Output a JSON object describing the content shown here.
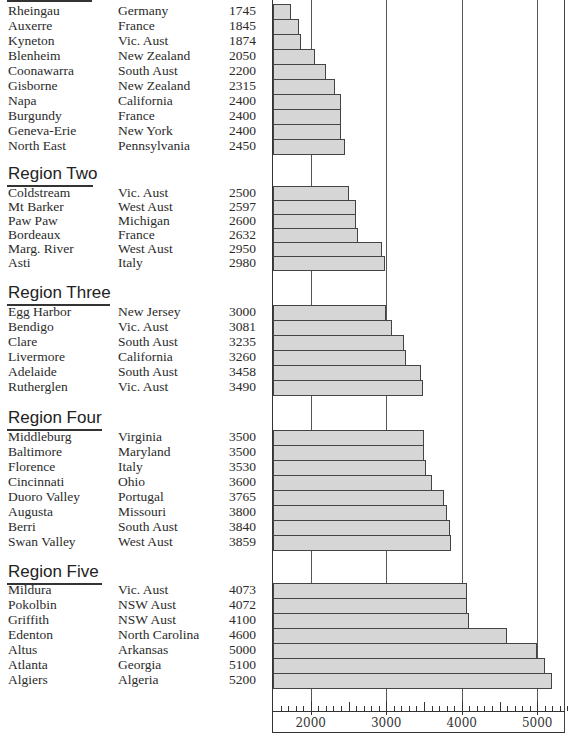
{
  "chart_data": {
    "type": "bar",
    "orientation": "horizontal",
    "title": "",
    "xlabel": "",
    "ylabel": "",
    "xlim": [
      1500,
      5400
    ],
    "x_ticks": [
      2000,
      3000,
      4000,
      5000
    ],
    "x_tick_labels": [
      "2000",
      "3000",
      "4000",
      "5000"
    ],
    "minor_tick_step": 100,
    "gridlines": "vertical at major ticks",
    "bar_color": "#d6d6d6",
    "bar_edge_color": "#444444",
    "groups": [
      {
        "name": "Region One",
        "heading_visible": false,
        "rows": [
          {
            "place": "Rheingau",
            "location": "Germany",
            "value": 1745
          },
          {
            "place": "Auxerre",
            "location": "France",
            "value": 1845
          },
          {
            "place": "Kyneton",
            "location": "Vic. Aust",
            "value": 1874
          },
          {
            "place": "Blenheim",
            "location": "New Zealand",
            "value": 2050
          },
          {
            "place": "Coonawarra",
            "location": "South Aust",
            "value": 2200
          },
          {
            "place": "Gisborne",
            "location": "New Zealand",
            "value": 2315
          },
          {
            "place": "Napa",
            "location": "California",
            "value": 2400
          },
          {
            "place": "Burgundy",
            "location": "France",
            "value": 2400
          },
          {
            "place": "Geneva-Erie",
            "location": "New York",
            "value": 2400
          },
          {
            "place": "North East",
            "location": "Pennsylvania",
            "value": 2450
          }
        ]
      },
      {
        "name": "Region Two",
        "heading_visible": true,
        "rows": [
          {
            "place": "Coldstream",
            "location": "Vic. Aust",
            "value": 2500
          },
          {
            "place": "Mt Barker",
            "location": "West Aust",
            "value": 2597
          },
          {
            "place": "Paw Paw",
            "location": "Michigan",
            "value": 2600
          },
          {
            "place": "Bordeaux",
            "location": "France",
            "value": 2632
          },
          {
            "place": "Marg. River",
            "location": "West Aust",
            "value": 2950
          },
          {
            "place": "Asti",
            "location": "Italy",
            "value": 2980
          }
        ]
      },
      {
        "name": "Region Three",
        "heading_visible": true,
        "rows": [
          {
            "place": "Egg Harbor",
            "location": "New Jersey",
            "value": 3000
          },
          {
            "place": "Bendigo",
            "location": "Vic. Aust",
            "value": 3081
          },
          {
            "place": "Clare",
            "location": "South Aust",
            "value": 3235
          },
          {
            "place": "Livermore",
            "location": "California",
            "value": 3260
          },
          {
            "place": "Adelaide",
            "location": "South Aust",
            "value": 3458
          },
          {
            "place": "Rutherglen",
            "location": "Vic. Aust",
            "value": 3490
          }
        ]
      },
      {
        "name": "Region Four",
        "heading_visible": true,
        "rows": [
          {
            "place": "Middleburg",
            "location": "Virginia",
            "value": 3500
          },
          {
            "place": "Baltimore",
            "location": "Maryland",
            "value": 3500
          },
          {
            "place": "Florence",
            "location": "Italy",
            "value": 3530
          },
          {
            "place": "Cincinnati",
            "location": "Ohio",
            "value": 3600
          },
          {
            "place": "Duoro Valley",
            "location": "Portugal",
            "value": 3765
          },
          {
            "place": "Augusta",
            "location": "Missouri",
            "value": 3800
          },
          {
            "place": "Berri",
            "location": "South Aust",
            "value": 3840
          },
          {
            "place": "Swan Valley",
            "location": "West Aust",
            "value": 3859
          }
        ]
      },
      {
        "name": "Region Five",
        "heading_visible": true,
        "rows": [
          {
            "place": "Mildura",
            "location": "Vic. Aust",
            "value": 4073
          },
          {
            "place": "Pokolbin",
            "location": "NSW Aust",
            "value": 4072
          },
          {
            "place": "Griffith",
            "location": "NSW Aust",
            "value": 4100
          },
          {
            "place": "Edenton",
            "location": "North Carolina",
            "value": 4600
          },
          {
            "place": "Altus",
            "location": "Arkansas",
            "value": 5000
          },
          {
            "place": "Atlanta",
            "location": "Georgia",
            "value": 5100
          },
          {
            "place": "Algiers",
            "location": "Algeria",
            "value": 5200
          }
        ]
      }
    ]
  },
  "layout": {
    "group_top": [
      4,
      186,
      305,
      430,
      583
    ],
    "heading_top": [
      -16,
      164,
      283,
      408,
      562
    ],
    "row_height": [
      15,
      14,
      15,
      15,
      15
    ]
  }
}
